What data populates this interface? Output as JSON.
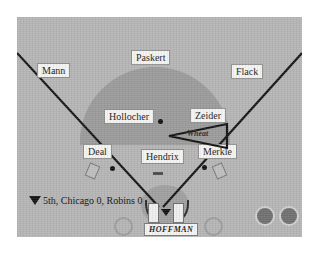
{
  "field": {
    "bg_color": "#b4b4b4",
    "dirt_color": "#9a9a9a",
    "line_color": "#151515"
  },
  "fielders": [
    {
      "name": "Mann",
      "position": "left-fielder"
    },
    {
      "name": "Paskert",
      "position": "center-fielder"
    },
    {
      "name": "Flack",
      "position": "right-fielder"
    },
    {
      "name": "Hollocher",
      "position": "shortstop"
    },
    {
      "name": "Zeider",
      "position": "second-baseman"
    },
    {
      "name": "Deal",
      "position": "third-baseman"
    },
    {
      "name": "Hendrix",
      "position": "pitcher"
    },
    {
      "name": "Merkle",
      "position": "first-baseman"
    }
  ],
  "hit": {
    "batter_arrow_label": "Wheat",
    "direction": "left"
  },
  "status": {
    "icon": "down-triangle-icon",
    "text": "5th, Chicago 0, Robins 0",
    "inning": "5th",
    "away_team": "Chicago",
    "away_score": "0",
    "home_team": "Robins",
    "home_score": "0"
  },
  "batter": {
    "name": "HOFFMAN"
  },
  "indicators": {
    "count": 2,
    "color": "#6f6f6f"
  },
  "on_deck_circles": {
    "count": 2
  }
}
